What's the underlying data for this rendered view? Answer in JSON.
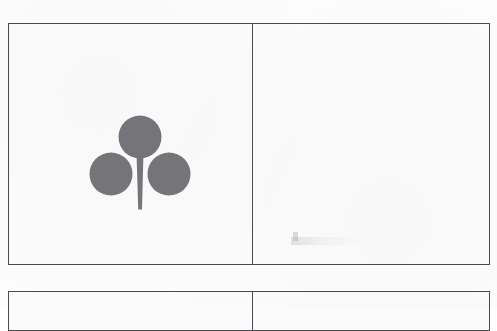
{
  "document": {
    "type": "scanned-sheet",
    "description": "Scanned page showing a grid of bordered card cells; the first cell contains a club (clover) suit symbol.",
    "background_color": "#fcfcfd",
    "border_color": "#4a4a4f"
  },
  "grid": {
    "rows": [
      {
        "id": "row-1",
        "cells": [
          {
            "id": "cell-1-1",
            "content": "club-suit-symbol",
            "empty": false
          },
          {
            "id": "cell-1-2",
            "content": "",
            "empty": true
          }
        ]
      },
      {
        "id": "row-2",
        "cells": [
          {
            "id": "cell-2-1",
            "content": "",
            "empty": true
          },
          {
            "id": "cell-2-2",
            "content": "",
            "empty": true
          }
        ]
      }
    ]
  },
  "suit": {
    "name": "club",
    "glyph": "♣",
    "fill_color": "#76767a",
    "lobes": [
      {
        "position": "top",
        "cx": 56,
        "cy": 23,
        "r": 21
      },
      {
        "position": "bottom-left",
        "cx": 22,
        "cy": 62,
        "r": 21
      },
      {
        "position": "bottom-right",
        "cx": 78,
        "cy": 62,
        "r": 21
      }
    ],
    "stem": {
      "top_width": 7,
      "bottom_width": 4,
      "top_y": 45,
      "bottom_y": 98
    }
  },
  "artifacts": {
    "smudge_label": "scan-smudge",
    "smudge_color": "#96989e"
  }
}
